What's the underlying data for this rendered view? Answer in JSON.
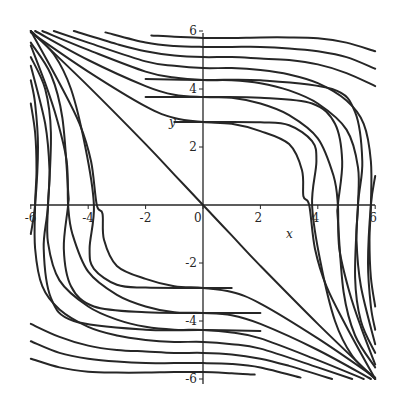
{
  "chart_data": {
    "type": "line",
    "title": "",
    "xlabel": "x",
    "ylabel": "y",
    "xlim": [
      -6,
      6
    ],
    "ylim": [
      -6,
      6
    ],
    "grid": false,
    "legend": null,
    "x_ticks": [
      "-6",
      "-4",
      "-2",
      "0",
      "2",
      "4",
      "6"
    ],
    "y_ticks": [
      "6",
      "4",
      "2",
      "-2",
      "-4",
      "-6"
    ],
    "series": [
      {
        "name": "separatrix",
        "points": [
          [
            -6,
            6
          ],
          [
            -4,
            4.1
          ],
          [
            -2,
            2.1
          ],
          [
            -1,
            1.05
          ],
          [
            0,
            0
          ],
          [
            1,
            -1.05
          ],
          [
            2,
            -2.1
          ],
          [
            4,
            -4.1
          ],
          [
            6,
            -6
          ]
        ]
      },
      {
        "name": "curve-1",
        "points": [
          [
            -6,
            5.95
          ],
          [
            -4,
            4.6
          ],
          [
            -2,
            3.4
          ],
          [
            -1,
            3.0
          ],
          [
            0,
            2.86
          ],
          [
            1,
            2.8
          ],
          [
            2,
            2.55
          ],
          [
            3,
            2.1
          ],
          [
            3.45,
            1.2
          ],
          [
            3.5,
            0.3
          ],
          [
            3.7,
            0
          ],
          [
            3.9,
            -1.5
          ],
          [
            4.3,
            -2.8
          ],
          [
            5,
            -4.2
          ],
          [
            6,
            -6
          ]
        ]
      },
      {
        "name": "curve-2",
        "points": [
          [
            -5.85,
            6
          ],
          [
            -4,
            5.0
          ],
          [
            -2,
            4.1
          ],
          [
            -1,
            3.8
          ],
          [
            0,
            3.72
          ],
          [
            1,
            3.7
          ],
          [
            2,
            3.5
          ],
          [
            3,
            3.1
          ],
          [
            4,
            2.3
          ],
          [
            4.55,
            1.0
          ],
          [
            4.7,
            0
          ],
          [
            4.75,
            -1.5
          ],
          [
            5.1,
            -3.0
          ],
          [
            5.5,
            -4.2
          ],
          [
            6,
            -5.5
          ]
        ]
      },
      {
        "name": "curve-3",
        "points": [
          [
            -5.6,
            6
          ],
          [
            -4,
            5.35
          ],
          [
            -2,
            4.6
          ],
          [
            -1,
            4.4
          ],
          [
            0,
            4.31
          ],
          [
            1,
            4.3
          ],
          [
            2,
            4.2
          ],
          [
            3,
            3.95
          ],
          [
            4,
            3.5
          ],
          [
            5,
            2.6
          ],
          [
            5.4,
            1.3
          ],
          [
            5.4,
            0
          ],
          [
            5.35,
            -1.2
          ],
          [
            5.5,
            -2.8
          ],
          [
            6,
            -4.8
          ]
        ]
      },
      {
        "name": "curve-4",
        "points": [
          [
            -5.2,
            6
          ],
          [
            -4,
            5.6
          ],
          [
            -2,
            4.95
          ],
          [
            -1,
            4.8
          ],
          [
            0,
            4.72
          ],
          [
            1,
            4.72
          ],
          [
            2,
            4.65
          ],
          [
            3,
            4.5
          ],
          [
            4,
            4.2
          ],
          [
            5,
            3.6
          ],
          [
            5.6,
            2.8
          ],
          [
            5.85,
            1.5
          ],
          [
            5.85,
            0
          ],
          [
            5.8,
            -1.2
          ],
          [
            5.85,
            -2.5
          ],
          [
            6,
            -3.5
          ]
        ]
      },
      {
        "name": "curve-5",
        "points": [
          [
            -4.5,
            6
          ],
          [
            -3,
            5.55
          ],
          [
            -2,
            5.3
          ],
          [
            -1,
            5.15
          ],
          [
            0,
            5.1
          ],
          [
            1,
            5.1
          ],
          [
            2,
            5.05
          ],
          [
            3,
            5.0
          ],
          [
            4,
            4.85
          ],
          [
            5,
            4.55
          ],
          [
            6,
            4.1
          ]
        ]
      },
      {
        "name": "curve-6",
        "points": [
          [
            -3.4,
            5.95
          ],
          [
            -2,
            5.6
          ],
          [
            -1,
            5.48
          ],
          [
            0,
            5.45
          ],
          [
            1,
            5.45
          ],
          [
            2,
            5.45
          ],
          [
            3,
            5.4
          ],
          [
            4,
            5.3
          ],
          [
            5,
            5.1
          ],
          [
            6,
            4.7
          ]
        ]
      },
      {
        "name": "curve-7",
        "points": [
          [
            -1.8,
            5.85
          ],
          [
            -1,
            5.8
          ],
          [
            0,
            5.76
          ],
          [
            1,
            5.76
          ],
          [
            2,
            5.78
          ],
          [
            3,
            5.78
          ],
          [
            4,
            5.75
          ],
          [
            5,
            5.6
          ],
          [
            6,
            5.3
          ]
        ]
      },
      {
        "name": "left-1",
        "points": [
          [
            -6,
            6
          ],
          [
            -5.2,
            5.2
          ],
          [
            -4.6,
            4.0
          ],
          [
            -4.1,
            2.0
          ],
          [
            -3.8,
            0
          ],
          [
            -3.95,
            -1.5
          ],
          [
            -3.8,
            -2.2
          ],
          [
            -3,
            -2.75
          ],
          [
            -2,
            -2.85
          ],
          [
            0,
            -2.86
          ],
          [
            1,
            -2.86
          ]
        ]
      },
      {
        "name": "left-2",
        "points": [
          [
            -6,
            5.6
          ],
          [
            -5.3,
            4.5
          ],
          [
            -4.9,
            3.0
          ],
          [
            -4.7,
            0.5
          ],
          [
            -4.7,
            0
          ],
          [
            -4.85,
            -1.5
          ],
          [
            -4.6,
            -2.8
          ],
          [
            -3.8,
            -3.5
          ],
          [
            -2,
            -3.7
          ],
          [
            0,
            -3.72
          ],
          [
            2,
            -3.72
          ]
        ]
      },
      {
        "name": "left-3",
        "points": [
          [
            -6,
            5.1
          ],
          [
            -5.5,
            4.0
          ],
          [
            -5.3,
            2.5
          ],
          [
            -5.4,
            0
          ],
          [
            -5.55,
            -1.5
          ],
          [
            -5.3,
            -3.2
          ],
          [
            -4.5,
            -4.0
          ],
          [
            -2,
            -4.3
          ],
          [
            0,
            -4.31
          ],
          [
            2,
            -4.35
          ]
        ]
      },
      {
        "name": "left-4",
        "points": [
          [
            -6,
            4.3
          ],
          [
            -5.85,
            3.5
          ],
          [
            -5.75,
            2.0
          ],
          [
            -5.85,
            0
          ],
          [
            -6,
            -1.0
          ]
        ]
      }
    ]
  },
  "axes": {
    "x_label": "x",
    "y_label": "y",
    "x_ticks": [
      {
        "value": -6,
        "label": "-6"
      },
      {
        "value": -4,
        "label": "-4"
      },
      {
        "value": -2,
        "label": "-2"
      },
      {
        "value": 0,
        "label": "0"
      },
      {
        "value": 2,
        "label": "2"
      },
      {
        "value": 4,
        "label": "4"
      },
      {
        "value": 6,
        "label": "6"
      }
    ],
    "y_ticks": [
      {
        "value": 6,
        "label": "6"
      },
      {
        "value": 4,
        "label": "4"
      },
      {
        "value": 2,
        "label": "2"
      },
      {
        "value": -2,
        "label": "-2"
      },
      {
        "value": -4,
        "label": "-4"
      },
      {
        "value": -6,
        "label": "-6"
      }
    ]
  },
  "colors": {
    "curve": "#262626",
    "background": "#ffffff"
  }
}
